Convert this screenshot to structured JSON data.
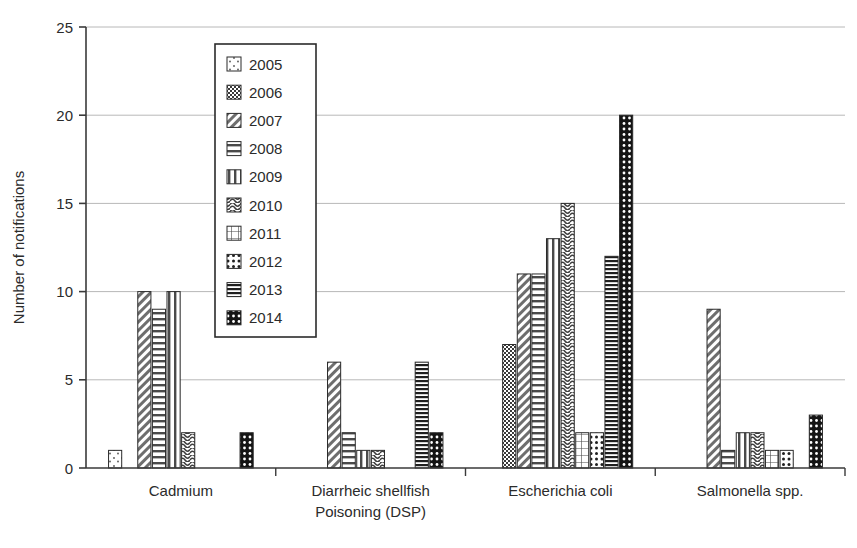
{
  "chart_data": {
    "type": "bar",
    "title": "",
    "subtitle": "",
    "xlabel": "",
    "ylabel": "Number of notifications",
    "ylim": [
      0,
      25
    ],
    "ytick_values": [
      0,
      5,
      10,
      15,
      20,
      25
    ],
    "ytick_labels": [
      "0",
      "5",
      "10",
      "15",
      "20",
      "25"
    ],
    "grid": "horizontal",
    "legend_position": "top-center-inside",
    "categories": [
      "Cadmium",
      "Diarrheic shellfish Poisoning (DSP)",
      "Escherichia coli",
      "Salmonella spp."
    ],
    "category_label_lines": [
      [
        "Cadmium"
      ],
      [
        "Diarrheic shellfish",
        "Poisoning (DSP)"
      ],
      [
        "Escherichia coli"
      ],
      [
        "Salmonella spp."
      ]
    ],
    "series": [
      {
        "name": "2005",
        "pattern": "sparse-dots-light",
        "values": [
          1,
          0,
          0,
          0
        ]
      },
      {
        "name": "2006",
        "pattern": "fine-checker",
        "values": [
          0,
          0,
          7,
          0
        ]
      },
      {
        "name": "2007",
        "pattern": "diagonal-hatch",
        "values": [
          10,
          6,
          11,
          9
        ]
      },
      {
        "name": "2008",
        "pattern": "horizontal-lines",
        "values": [
          9,
          2,
          11,
          1
        ]
      },
      {
        "name": "2009",
        "pattern": "vertical-lines",
        "values": [
          10,
          1,
          13,
          2
        ]
      },
      {
        "name": "2010",
        "pattern": "wavy-lines",
        "values": [
          2,
          1,
          15,
          2
        ]
      },
      {
        "name": "2011",
        "pattern": "grid-crosshatch",
        "values": [
          0,
          0,
          2,
          1
        ]
      },
      {
        "name": "2012",
        "pattern": "white-dots",
        "values": [
          0,
          0,
          2,
          1
        ]
      },
      {
        "name": "2013",
        "pattern": "dense-horizontal",
        "values": [
          0,
          6,
          12,
          0
        ]
      },
      {
        "name": "2014",
        "pattern": "black-dots",
        "values": [
          2,
          2,
          20,
          3
        ]
      }
    ]
  },
  "legend": {
    "entries": [
      {
        "label": "2005"
      },
      {
        "label": "2006"
      },
      {
        "label": "2007"
      },
      {
        "label": "2008"
      },
      {
        "label": "2009"
      },
      {
        "label": "2010"
      },
      {
        "label": "2011"
      },
      {
        "label": "2012"
      },
      {
        "label": "2013"
      },
      {
        "label": "2014"
      }
    ]
  },
  "colors": {
    "axis": "#3a3a3a",
    "grid": "#b8b8b8",
    "bar_stroke": "#2b2b2b",
    "bar_fill_light": "#ffffff",
    "bar_fill_dark": "#141414",
    "text": "#2b2b2b"
  }
}
